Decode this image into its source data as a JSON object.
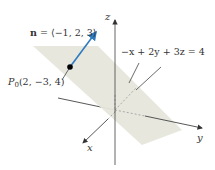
{
  "diagram": {
    "normal_label": "n = ⟨−1, 2, 3⟩",
    "normal_label_bold": "n",
    "normal_label_rest": " = ⟨−1, 2, 3⟩",
    "point_label_P": "P",
    "point_label_sub": "0",
    "point_label_rest": "(2, −3, 4)",
    "plane_equation": "−x + 2y + 3z = 4",
    "axis_x": "x",
    "axis_y": "y",
    "axis_z": "z",
    "colors": {
      "normal_vector": "#2f7bbf",
      "plane_fill": "#e6e6dc",
      "axes": "#444444",
      "point": "#000000"
    }
  }
}
